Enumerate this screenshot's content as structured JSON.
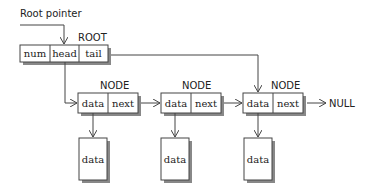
{
  "labels": {
    "root_pointer": "Root pointer",
    "root": "ROOT",
    "node": "NODE",
    "null": "NULL"
  },
  "root_fields": [
    "num",
    "head",
    "tail"
  ],
  "nodes": [
    {
      "label": "NODE",
      "fields": [
        "data",
        "next"
      ],
      "payload": "data"
    },
    {
      "label": "NODE",
      "fields": [
        "data",
        "next"
      ],
      "payload": "data"
    },
    {
      "label": "NODE",
      "fields": [
        "data",
        "next"
      ],
      "payload": "data"
    }
  ],
  "colors": {
    "stroke": "#444444",
    "shadow": "#888888",
    "background": "#ffffff"
  }
}
